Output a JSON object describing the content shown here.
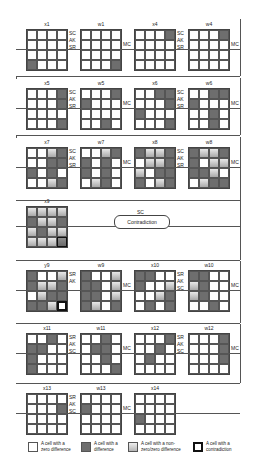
{
  "diagram": {
    "rows": [
      {
        "grids": [
          {
            "label": "x1",
            "cells": [
              "z",
              "z",
              "z",
              "z",
              "z",
              "z",
              "z",
              "z",
              "z",
              "z",
              "z",
              "z",
              "d",
              "z",
              "z",
              "z"
            ]
          },
          {
            "label": "w1",
            "cells": [
              "z",
              "z",
              "z",
              "z",
              "z",
              "z",
              "z",
              "z",
              "z",
              "z",
              "z",
              "z",
              "z",
              "z",
              "z",
              "d"
            ]
          },
          {
            "label": "x4",
            "cells": [
              "z",
              "z",
              "z",
              "d",
              "z",
              "z",
              "z",
              "z",
              "z",
              "z",
              "z",
              "z",
              "z",
              "z",
              "z",
              "z"
            ]
          },
          {
            "label": "w4",
            "cells": [
              "z",
              "z",
              "z",
              "d",
              "z",
              "z",
              "z",
              "z",
              "z",
              "z",
              "z",
              "z",
              "z",
              "z",
              "z",
              "z"
            ]
          }
        ],
        "ops": [
          "SC\nAK\nSR",
          "MC",
          "SC\nAK\nSR",
          "MC"
        ]
      },
      {
        "grids": [
          {
            "label": "x5",
            "cells": [
              "z",
              "z",
              "z",
              "d",
              "z",
              "z",
              "z",
              "d",
              "z",
              "z",
              "z",
              "z",
              "z",
              "z",
              "z",
              "d"
            ]
          },
          {
            "label": "w5",
            "cells": [
              "z",
              "z",
              "z",
              "d",
              "d",
              "z",
              "z",
              "z",
              "z",
              "z",
              "z",
              "z",
              "z",
              "z",
              "d",
              "z"
            ]
          },
          {
            "label": "x6",
            "cells": [
              "z",
              "z",
              "d",
              "d",
              "z",
              "z",
              "z",
              "d",
              "d",
              "z",
              "z",
              "z",
              "z",
              "z",
              "z",
              "d"
            ]
          },
          {
            "label": "w6",
            "cells": [
              "z",
              "z",
              "d",
              "d",
              "d",
              "z",
              "z",
              "z",
              "z",
              "z",
              "d",
              "z",
              "z",
              "z",
              "d",
              "z"
            ]
          }
        ],
        "ops": [
          "SC\nAK\nSR",
          "MC",
          "SC\nAK\nSR",
          "MC"
        ]
      },
      {
        "grids": [
          {
            "label": "x7",
            "cells": [
              "z",
              "z",
              "p",
              "d",
              "z",
              "z",
              "d",
              "d",
              "d",
              "z",
              "d",
              "z",
              "z",
              "z",
              "p",
              "d"
            ]
          },
          {
            "label": "w7",
            "cells": [
              "z",
              "z",
              "p",
              "d",
              "d",
              "z",
              "d",
              "z",
              "d",
              "z",
              "d",
              "z",
              "z",
              "p",
              "d",
              "z"
            ]
          },
          {
            "label": "x8",
            "cells": [
              "d",
              "p",
              "p",
              "d",
              "z",
              "p",
              "p",
              "d",
              "p",
              "z",
              "d",
              "d",
              "d",
              "z",
              "p",
              "d"
            ]
          },
          {
            "label": "w8",
            "cells": [
              "d",
              "p",
              "p",
              "d",
              "d",
              "z",
              "p",
              "p",
              "d",
              "d",
              "p",
              "z",
              "z",
              "p",
              "d",
              "d"
            ]
          }
        ],
        "ops": [
          "SC\nAK\nSR",
          "MC",
          "SC\nAK\nSR",
          "MC"
        ]
      },
      {
        "grids": [
          {
            "label": "x9",
            "cells": [
              "p",
              "p",
              "p",
              "p",
              "d",
              "p",
              "p",
              "d",
              "p",
              "d",
              "p",
              "p",
              "p",
              "p",
              "p",
              "pc"
            ]
          }
        ],
        "ops": [
          "SC"
        ],
        "contradiction_label": "Contradiction"
      },
      {
        "grids": [
          {
            "label": "y9",
            "cells": [
              "d",
              "z",
              "z",
              "p",
              "d",
              "p",
              "p",
              "d",
              "z",
              "p",
              "d",
              "d",
              "d",
              "d",
              "p",
              "c"
            ]
          },
          {
            "label": "w9",
            "cells": [
              "d",
              "z",
              "z",
              "p",
              "d",
              "d",
              "z",
              "p",
              "d",
              "d",
              "z",
              "p",
              "d",
              "p",
              "z",
              "d"
            ]
          },
          {
            "label": "x10",
            "cells": [
              "d",
              "d",
              "z",
              "z",
              "d",
              "z",
              "z",
              "p",
              "z",
              "z",
              "p",
              "d",
              "z",
              "d",
              "z",
              "d"
            ]
          },
          {
            "label": "w10",
            "cells": [
              "d",
              "d",
              "z",
              "z",
              "p",
              "d",
              "z",
              "z",
              "p",
              "d",
              "z",
              "z",
              "z",
              "z",
              "d",
              "z"
            ]
          }
        ],
        "ops": [
          "SR\nAK",
          "MC",
          "SR\nAK\nSC",
          "MC"
        ]
      },
      {
        "grids": [
          {
            "label": "x11",
            "cells": [
              "z",
              "z",
              "d",
              "z",
              "d",
              "d",
              "z",
              "z",
              "d",
              "z",
              "z",
              "z",
              "d",
              "z",
              "z",
              "z"
            ]
          },
          {
            "label": "w11",
            "cells": [
              "z",
              "z",
              "d",
              "z",
              "z",
              "d",
              "d",
              "z",
              "z",
              "z",
              "d",
              "z",
              "z",
              "z",
              "z",
              "d"
            ]
          },
          {
            "label": "x12",
            "cells": [
              "z",
              "z",
              "z",
              "d",
              "z",
              "z",
              "d",
              "z",
              "z",
              "d",
              "z",
              "z",
              "z",
              "z",
              "z",
              "z"
            ]
          },
          {
            "label": "w12",
            "cells": [
              "z",
              "z",
              "z",
              "d",
              "z",
              "z",
              "z",
              "d",
              "z",
              "z",
              "z",
              "d",
              "z",
              "z",
              "z",
              "z"
            ]
          }
        ],
        "ops": [
          "SR\nAK\nSC",
          "MC",
          "SR\nAK\nSC",
          "MC"
        ]
      },
      {
        "grids": [
          {
            "label": "x13",
            "cells": [
              "z",
              "z",
              "z",
              "z",
              "z",
              "z",
              "z",
              "d",
              "z",
              "z",
              "z",
              "z",
              "z",
              "z",
              "z",
              "z"
            ]
          },
          {
            "label": "w13",
            "cells": [
              "z",
              "z",
              "z",
              "z",
              "d",
              "z",
              "z",
              "z",
              "z",
              "z",
              "z",
              "z",
              "z",
              "z",
              "z",
              "z"
            ]
          },
          {
            "label": "x14",
            "cells": [
              "z",
              "z",
              "z",
              "z",
              "z",
              "z",
              "z",
              "z",
              "d",
              "z",
              "z",
              "z",
              "z",
              "z",
              "z",
              "z"
            ]
          }
        ],
        "ops": [
          "SR\nAK\nSC",
          "MC"
        ]
      }
    ]
  },
  "labels": {
    "r0": [
      "x1",
      "w1",
      "x4",
      "w4"
    ],
    "r1": [
      "x5",
      "w5",
      "x6",
      "w6"
    ],
    "r2": [
      "x7",
      "w7",
      "x8",
      "w8"
    ],
    "r3": [
      "x9"
    ],
    "r4": [
      "y9",
      "w9",
      "x10",
      "w10"
    ],
    "r5": [
      "x11",
      "w11",
      "x12",
      "w12"
    ],
    "r6": [
      "x13",
      "w13",
      "x14"
    ]
  },
  "ops": {
    "sc": "SC",
    "ak": "AK",
    "sr": "SR",
    "mc": "MC"
  },
  "contradiction": "Contradiction",
  "legend": [
    {
      "label_1": "A cell with a",
      "label_2": "zero difference"
    },
    {
      "label_1": "A cell with a",
      "label_2": "difference"
    },
    {
      "label_1": "A cell with a non-",
      "label_2": "zero/zero difference"
    },
    {
      "label_1": "A cell with a",
      "label_2": "contradiction"
    }
  ],
  "colors": {
    "difference": "#6e6e6e",
    "zero": "#ffffff",
    "partial": "#c0c0c0",
    "contradiction_border": "#111111"
  }
}
